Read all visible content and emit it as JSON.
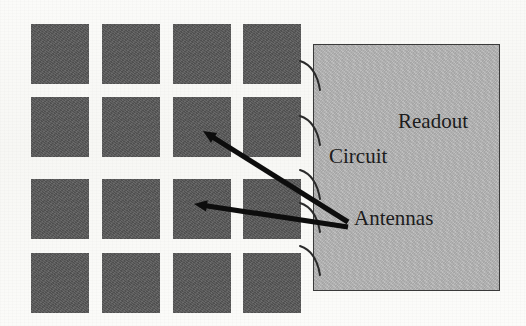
{
  "figure": {
    "title_text": "",
    "background_color": "#fbfbf9",
    "labels": {
      "readout": "Readout",
      "circuit": "Circuit",
      "antennas": "Antennas"
    },
    "colors": {
      "antenna_fill": "#585858",
      "readout_fill": "#b4b4b4",
      "readout_border": "#3a3a3a",
      "arrow": "#0d0d0d",
      "connector": "#2b2b2b",
      "text": "#1c1c1c"
    },
    "antenna_array": {
      "rows": 4,
      "columns": 4,
      "cell_width": 58,
      "cell_height": 60,
      "column_x": [
        31,
        102,
        173,
        243
      ],
      "row_y": [
        24,
        97,
        179,
        253
      ],
      "count": 16
    },
    "readout_box": {
      "x": 313,
      "y": 44,
      "width": 187,
      "height": 247
    },
    "connectors": [
      {
        "name": "connector-1",
        "x1": 300,
        "y1": 61,
        "cx": 316,
        "cy": 66,
        "x2": 320,
        "y2": 90
      },
      {
        "name": "connector-2",
        "x1": 300,
        "y1": 116,
        "cx": 316,
        "cy": 121,
        "x2": 320,
        "y2": 145
      },
      {
        "name": "connector-3",
        "x1": 300,
        "y1": 170,
        "cx": 316,
        "cy": 175,
        "x2": 320,
        "y2": 199
      },
      {
        "name": "connector-4",
        "x1": 300,
        "y1": 203,
        "cx": 316,
        "cy": 208,
        "x2": 320,
        "y2": 232
      },
      {
        "name": "connector-5",
        "x1": 300,
        "y1": 246,
        "cx": 316,
        "cy": 251,
        "x2": 320,
        "y2": 275
      }
    ],
    "arrows": [
      {
        "name": "arrow-to-antenna-upper",
        "x1": 348,
        "y1": 222,
        "x2": 203,
        "y2": 131,
        "width": 5.2,
        "head_size": 13
      },
      {
        "name": "arrow-to-antenna-lower",
        "x1": 348,
        "y1": 227,
        "x2": 194,
        "y2": 204,
        "width": 5.2,
        "head_size": 13
      }
    ]
  }
}
